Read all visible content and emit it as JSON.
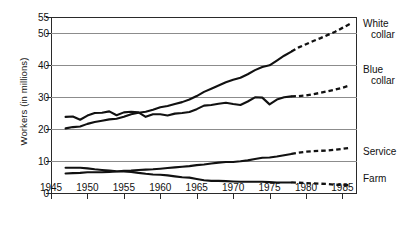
{
  "chart_data": {
    "type": "line",
    "title": "",
    "xlabel": "",
    "ylabel": "Workers (in millions)",
    "xlim": [
      1945,
      1987
    ],
    "ylim": [
      0,
      55
    ],
    "grid": true,
    "legend_position": "right-of-plot",
    "x_ticks": [
      "1945",
      "1950",
      "1955",
      "1960",
      "1965",
      "1970",
      "1975",
      "1980",
      "1985"
    ],
    "x_tick_values": [
      1945,
      1950,
      1955,
      1960,
      1965,
      1970,
      1975,
      1980,
      1985
    ],
    "y_ticks": [
      "0",
      "10",
      "20",
      "30",
      "40",
      "50",
      "55"
    ],
    "y_tick_values": [
      0,
      10,
      20,
      30,
      40,
      50,
      55
    ],
    "series": [
      {
        "name": "White collar",
        "label_line1": "White",
        "label_line2": "collar",
        "style_historical": "solid",
        "style_projected": "dashed",
        "projection_starts": 1978,
        "x": [
          1947,
          1948,
          1949,
          1950,
          1951,
          1952,
          1953,
          1954,
          1955,
          1956,
          1957,
          1958,
          1959,
          1960,
          1961,
          1962,
          1963,
          1964,
          1965,
          1966,
          1967,
          1968,
          1969,
          1970,
          1971,
          1972,
          1973,
          1974,
          1975,
          1976,
          1977,
          1978,
          1979,
          1980,
          1981,
          1982,
          1983,
          1984,
          1985,
          1986
        ],
        "y": [
          20.2,
          20.6,
          20.8,
          21.6,
          22.2,
          22.6,
          23.0,
          23.2,
          23.8,
          24.6,
          25.1,
          25.4,
          26.0,
          26.8,
          27.2,
          27.8,
          28.4,
          29.2,
          30.3,
          31.6,
          32.6,
          33.6,
          34.6,
          35.4,
          36.0,
          37.1,
          38.4,
          39.4,
          39.9,
          41.4,
          42.9,
          44.2,
          45.5,
          46.5,
          47.5,
          48.4,
          49.4,
          50.4,
          51.6,
          52.8
        ]
      },
      {
        "name": "Blue collar",
        "label_line1": "Blue",
        "label_line2": "collar",
        "style_historical": "solid",
        "style_projected": "dashed",
        "projection_starts": 1978,
        "x": [
          1947,
          1948,
          1949,
          1950,
          1951,
          1952,
          1953,
          1954,
          1955,
          1956,
          1957,
          1958,
          1959,
          1960,
          1961,
          1962,
          1963,
          1964,
          1965,
          1966,
          1967,
          1968,
          1969,
          1970,
          1971,
          1972,
          1973,
          1974,
          1975,
          1976,
          1977,
          1978,
          1979,
          1980,
          1981,
          1982,
          1983,
          1984,
          1985,
          1986
        ],
        "y": [
          23.8,
          23.9,
          22.9,
          24.2,
          25.0,
          25.1,
          25.5,
          24.3,
          25.2,
          25.4,
          25.2,
          23.8,
          24.6,
          24.6,
          24.2,
          24.8,
          25.0,
          25.3,
          26.2,
          27.3,
          27.5,
          27.9,
          28.2,
          27.8,
          27.5,
          28.6,
          29.9,
          29.8,
          27.7,
          29.2,
          29.9,
          30.2,
          30.3,
          30.5,
          30.9,
          31.3,
          31.8,
          32.3,
          32.9,
          33.6
        ]
      },
      {
        "name": "Service",
        "label_line1": "Service",
        "label_line2": "",
        "style_historical": "solid",
        "style_projected": "dashed",
        "projection_starts": 1978,
        "x": [
          1947,
          1948,
          1949,
          1950,
          1951,
          1952,
          1953,
          1954,
          1955,
          1956,
          1957,
          1958,
          1959,
          1960,
          1961,
          1962,
          1963,
          1964,
          1965,
          1966,
          1967,
          1968,
          1969,
          1970,
          1971,
          1972,
          1973,
          1974,
          1975,
          1976,
          1977,
          1978,
          1979,
          1980,
          1981,
          1982,
          1983,
          1984,
          1985,
          1986
        ],
        "y": [
          6.1,
          6.2,
          6.3,
          6.5,
          6.5,
          6.5,
          6.6,
          6.7,
          6.9,
          7.0,
          7.2,
          7.3,
          7.4,
          7.6,
          7.8,
          8.0,
          8.2,
          8.4,
          8.7,
          8.9,
          9.2,
          9.5,
          9.7,
          9.7,
          9.9,
          10.2,
          10.6,
          11.0,
          11.1,
          11.4,
          11.8,
          12.2,
          12.6,
          12.9,
          13.1,
          13.2,
          13.3,
          13.5,
          13.8,
          14.1
        ]
      },
      {
        "name": "Farm",
        "label_line1": "Farm",
        "label_line2": "",
        "style_historical": "solid",
        "style_projected": "dashed",
        "projection_starts": 1978,
        "x": [
          1947,
          1948,
          1949,
          1950,
          1951,
          1952,
          1953,
          1954,
          1955,
          1956,
          1957,
          1958,
          1959,
          1960,
          1961,
          1962,
          1963,
          1964,
          1965,
          1966,
          1967,
          1968,
          1969,
          1970,
          1971,
          1972,
          1973,
          1974,
          1975,
          1976,
          1977,
          1978,
          1979,
          1980,
          1981,
          1982,
          1983,
          1984,
          1985,
          1986
        ],
        "y": [
          7.9,
          7.9,
          7.9,
          7.7,
          7.4,
          7.2,
          7.0,
          6.8,
          6.7,
          6.6,
          6.3,
          6.0,
          5.8,
          5.7,
          5.5,
          5.2,
          4.9,
          4.8,
          4.4,
          4.0,
          3.8,
          3.8,
          3.7,
          3.6,
          3.5,
          3.5,
          3.5,
          3.5,
          3.4,
          3.3,
          3.3,
          3.3,
          3.2,
          3.1,
          3.0,
          2.9,
          2.8,
          2.6,
          2.5,
          2.4
        ]
      }
    ]
  },
  "labels": {
    "white_collar_l1": "White",
    "white_collar_l2": "collar",
    "blue_collar_l1": "Blue",
    "blue_collar_l2": "collar",
    "service": "Service",
    "farm": "Farm",
    "y_axis_title": "Workers (in millions)"
  }
}
